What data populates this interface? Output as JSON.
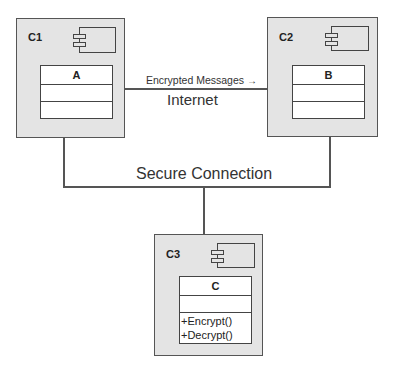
{
  "diagram": {
    "type": "UML component diagram",
    "components": [
      {
        "id": "C1",
        "label": "C1",
        "class": {
          "name": "A",
          "attributes": [],
          "operations": []
        }
      },
      {
        "id": "C2",
        "label": "C2",
        "class": {
          "name": "B",
          "attributes": [],
          "operations": []
        }
      },
      {
        "id": "C3",
        "label": "C3",
        "class": {
          "name": "C",
          "attributes": [],
          "operations": [
            "+Encrypt()",
            "+Decrypt()"
          ]
        }
      }
    ],
    "connections": [
      {
        "from": "C1",
        "to": "C2",
        "label": "Internet",
        "message": "Encrypted Messages",
        "arrow": "→"
      },
      {
        "from": [
          "C1",
          "C2"
        ],
        "to": "C3",
        "label": "Secure Connection"
      }
    ],
    "colors": {
      "component_fill": "#e4e4e4",
      "line": "#555555",
      "class_fill": "#ffffff"
    }
  }
}
